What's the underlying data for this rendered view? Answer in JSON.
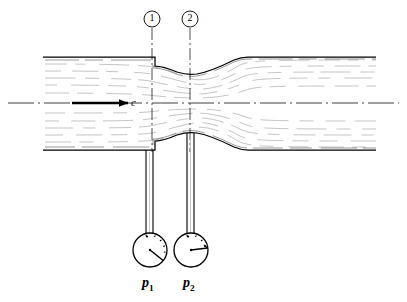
{
  "figure": {
    "type": "engineering-line-diagram",
    "width": 407,
    "height": 302,
    "background_color": "#ffffff",
    "line_color": "#000000",
    "streamline_color": "#9a9a9a"
  },
  "section_markers": [
    {
      "id": "section-1",
      "label": "1",
      "x": 152,
      "circle_center_y": 19,
      "circle_radius": 8
    },
    {
      "id": "section-2",
      "label": "2",
      "x": 190,
      "circle_center_y": 19,
      "circle_radius": 8
    }
  ],
  "flow": {
    "arrow_label": "c",
    "arrow_direction": "right",
    "arrow_x_start": 72,
    "arrow_x_end": 128,
    "arrow_y": 103
  },
  "pipe": {
    "top_wall_y": 57,
    "bottom_wall_y": 150,
    "centerline_y": 103,
    "left_x": 43,
    "right_x": 376,
    "throat_top_y": 72,
    "throat_bottom_y": 135,
    "contraction_step_x": 155,
    "expansion_end_x": 248
  },
  "gauges": [
    {
      "id": "gauge-1",
      "label": "p",
      "subscript": "1",
      "center_x": 150,
      "center_y": 250,
      "radius": 17,
      "needle_angle_deg": 40,
      "tube_x": 150,
      "tube_top_y": 150,
      "tube_bottom_y": 233,
      "reading": "higher"
    },
    {
      "id": "gauge-2",
      "label": "p",
      "subscript": "2",
      "center_x": 191,
      "center_y": 250,
      "radius": 17,
      "needle_angle_deg": 8,
      "tube_x": 191,
      "tube_top_y": 135,
      "tube_bottom_y": 233,
      "reading": "lower"
    }
  ],
  "labels": {
    "velocity": "c",
    "pressure_1": "p",
    "pressure_1_sub": "1",
    "pressure_2": "p",
    "pressure_2_sub": "2"
  }
}
